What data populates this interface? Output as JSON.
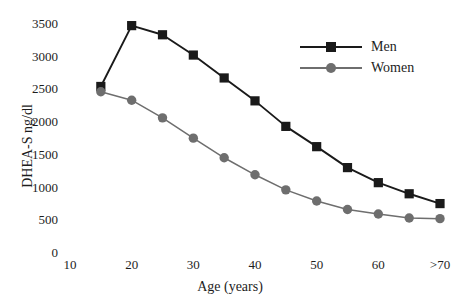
{
  "chart_data": {
    "type": "line",
    "title": "",
    "xlabel": "Age (years)",
    "ylabel": "DHEA-S ng/dl",
    "x": [
      15,
      20,
      25,
      30,
      35,
      40,
      45,
      50,
      55,
      60,
      65,
      70
    ],
    "xtick_labels": [
      "10",
      "20",
      "30",
      "40",
      "50",
      "60",
      ">70"
    ],
    "xtick_values": [
      10,
      20,
      30,
      40,
      50,
      60,
      70
    ],
    "ytick_labels": [
      "0",
      "500",
      "1000",
      "1500",
      "2000",
      "2500",
      "3000",
      "3500"
    ],
    "ytick_values": [
      0,
      500,
      1000,
      1500,
      2000,
      2500,
      3000,
      3500
    ],
    "xlim": [
      8,
      72
    ],
    "ylim": [
      0,
      3700
    ],
    "grid": false,
    "legend_position": "upper right",
    "series": [
      {
        "name": "Men",
        "color": "#1a1a1a",
        "marker": "square",
        "values": [
          2530,
          3460,
          3320,
          3010,
          2660,
          2310,
          1920,
          1610,
          1290,
          1060,
          890,
          740
        ]
      },
      {
        "name": "Women",
        "color": "#6e6e6e",
        "marker": "circle",
        "values": [
          2450,
          2320,
          2050,
          1740,
          1440,
          1180,
          950,
          780,
          650,
          580,
          520,
          510
        ]
      }
    ]
  },
  "legend": {
    "items": [
      {
        "label": "Men"
      },
      {
        "label": "Women"
      }
    ]
  }
}
